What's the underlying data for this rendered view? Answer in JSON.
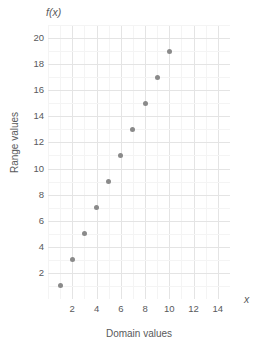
{
  "chart_data": {
    "type": "scatter",
    "title": "",
    "fx_label": "f(x)",
    "x_symbol": "x",
    "xlabel": "Domain values",
    "ylabel": "Range values",
    "x": [
      1,
      2,
      3,
      4,
      5,
      6,
      7,
      8,
      9,
      10
    ],
    "values": [
      1,
      3,
      5,
      7,
      9,
      11,
      13,
      15,
      17,
      19
    ],
    "series": [
      {
        "name": "f(x)",
        "points": [
          {
            "x": 1,
            "y": 1
          },
          {
            "x": 2,
            "y": 3
          },
          {
            "x": 3,
            "y": 5
          },
          {
            "x": 4,
            "y": 7
          },
          {
            "x": 5,
            "y": 9
          },
          {
            "x": 6,
            "y": 11
          },
          {
            "x": 7,
            "y": 13
          },
          {
            "x": 8,
            "y": 15
          },
          {
            "x": 9,
            "y": 17
          },
          {
            "x": 10,
            "y": 19
          }
        ],
        "marker_color": "#8a8a8a"
      }
    ],
    "xlim": [
      0,
      15
    ],
    "ylim": [
      0,
      21
    ],
    "xticks": [
      2,
      4,
      6,
      8,
      10,
      12,
      14
    ],
    "yticks": [
      2,
      4,
      6,
      8,
      10,
      12,
      14,
      16,
      18,
      20
    ],
    "x_minor_step": 1,
    "y_minor_step": 1,
    "grid": true,
    "legend": "none",
    "colors": {
      "marker": "#8a8a8a",
      "grid_major": "#e4e4e4",
      "grid_minor": "#f4f4f4",
      "text": "#58595b",
      "background": "#ffffff"
    }
  }
}
